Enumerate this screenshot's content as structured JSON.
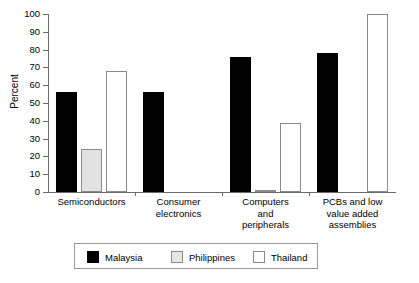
{
  "chart_data": {
    "type": "bar",
    "title": "",
    "subtitle": "",
    "xlabel": "",
    "ylabel": "Percent",
    "ylim": [
      0,
      100
    ],
    "ytick_labels": [
      "0",
      "10",
      "20",
      "30",
      "40",
      "50",
      "60",
      "70",
      "80",
      "90",
      "100"
    ],
    "ytick_values": [
      0,
      10,
      20,
      30,
      40,
      50,
      60,
      70,
      80,
      90,
      100
    ],
    "grid": false,
    "legend_position": "bottom",
    "categories": [
      "Semiconductors",
      "Consumer electronics",
      "Computers and peripherals",
      "PCBs and low value added assemblies"
    ],
    "category_label_lines": [
      [
        "Semiconductors"
      ],
      [
        "Consumer",
        "electronics"
      ],
      [
        "Computers",
        "and",
        "peripherals"
      ],
      [
        "PCBs and low",
        "value added",
        "assemblies"
      ]
    ],
    "series": [
      {
        "name": "Malaysia",
        "color": "#000000",
        "values": [
          56,
          56,
          76,
          78
        ]
      },
      {
        "name": "Philippines",
        "color": "#e2e2e2",
        "values": [
          24,
          0,
          1,
          0
        ]
      },
      {
        "name": "Thailand",
        "color": "#ffffff",
        "values": [
          68,
          0,
          39,
          100
        ]
      }
    ]
  },
  "legend": {
    "items": [
      {
        "label": "Malaysia"
      },
      {
        "label": "Philippines"
      },
      {
        "label": "Thailand"
      }
    ]
  }
}
